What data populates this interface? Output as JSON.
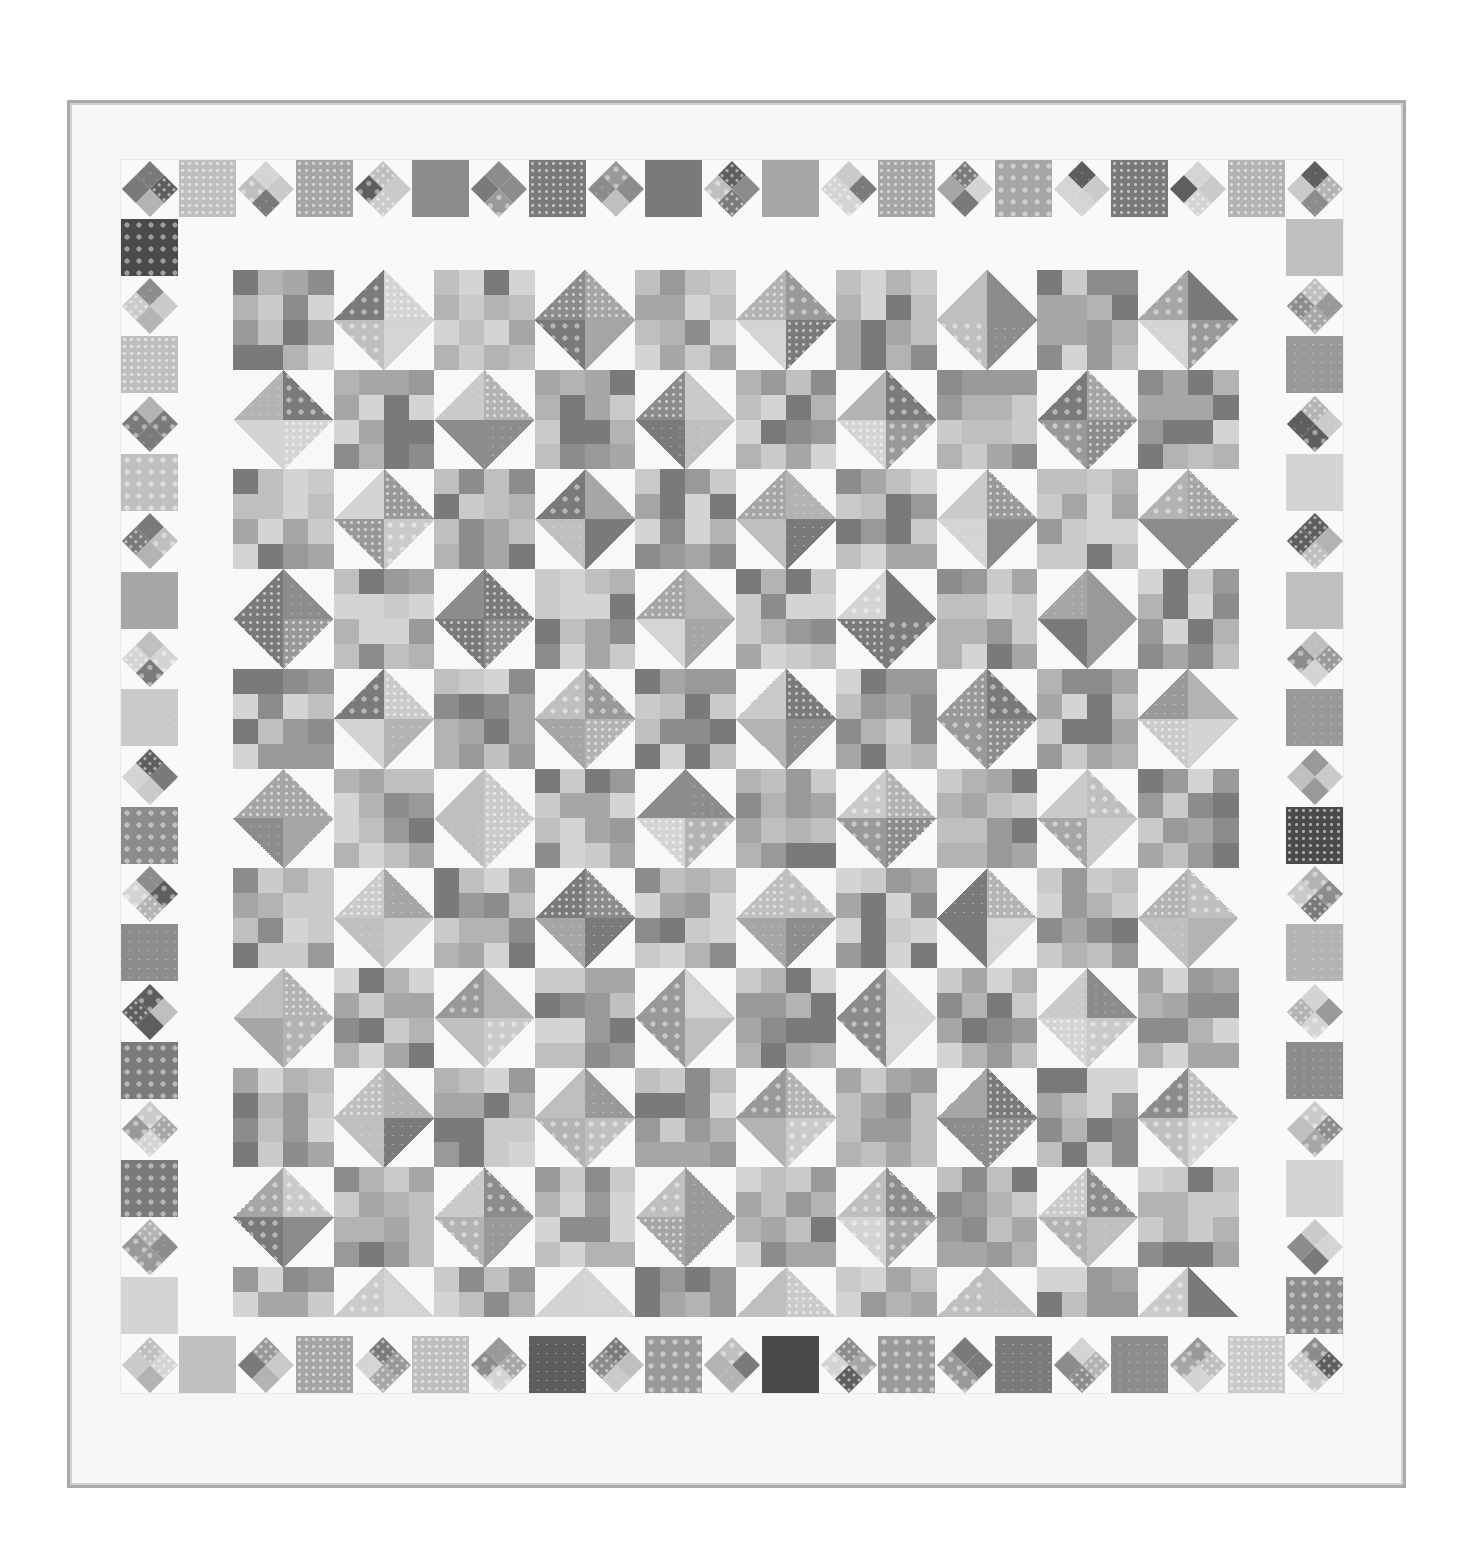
{
  "image": {
    "subject": "Scrappy patchwork quilt photographed flat",
    "palette": {
      "background": "#ffffff",
      "quilt_white": "#f6f6f6",
      "binding": "#a9a9a9",
      "fabric_tones": [
        "#7a7a7a",
        "#8c8c8c",
        "#999999",
        "#a6a6a6",
        "#b3b3b3",
        "#bfbfbf",
        "#cacaca",
        "#d4d4d4",
        "#5e5e5e",
        "#4a4a4a"
      ]
    },
    "layout": {
      "quilt": {
        "x": 67,
        "y": 100,
        "w": 1339,
        "h": 1388
      },
      "border_band": {
        "x": 121,
        "y": 160,
        "w": 1222,
        "h": 1233,
        "unit": 57
      },
      "center": {
        "x": 233,
        "y": 270,
        "w": 1005,
        "h": 1047,
        "cols": 20,
        "rows": 21
      }
    },
    "border": {
      "top_count": 21,
      "bottom_count": 21,
      "left_count": 19,
      "right_count": 19,
      "pattern": "alternating solid squares and on-point four-patch diamonds"
    },
    "center_blocks": "four-patches alternating with half-square-triangle units (white + print) forming diamonds"
  }
}
